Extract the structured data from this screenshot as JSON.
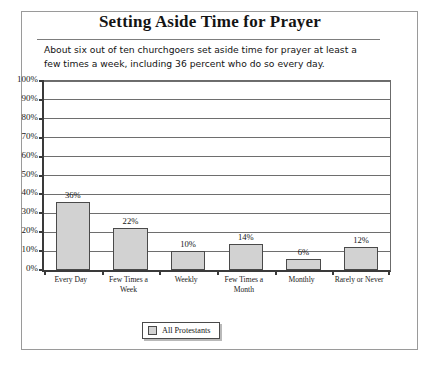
{
  "figure": {
    "title": "Setting Aside Time for Prayer",
    "subtitle": "About six out of ten churchgoers set aside time for prayer at least a few times a week, including 36 percent who do so every day."
  },
  "legend": {
    "label": "All Protestants",
    "swatch_color": "#d2d2d2",
    "position": "bottom-center"
  },
  "colors": {
    "bar_fill": "#d2d2d2",
    "bar_border": "#4a4a4a",
    "axis": "#3a3a3a",
    "gridline": "#6e6e6e",
    "frame": "#9a9a9a",
    "text": "#151515"
  },
  "chart_data": {
    "type": "bar",
    "title": "Setting Aside Time for Prayer",
    "subtitle": "About six out of ten churchgoers set aside time for prayer at least a few times a week, including 36 percent who do so every day.",
    "categories": [
      "Every Day",
      "Few Times a Week",
      "Weekly",
      "Few Times a Month",
      "Monthly",
      "Rarely or Never"
    ],
    "series": [
      {
        "name": "All Protestants",
        "values": [
          36,
          22,
          10,
          14,
          6,
          12
        ]
      }
    ],
    "data_labels": [
      "36%",
      "22%",
      "10%",
      "14%",
      "6%",
      "12%"
    ],
    "xlabel": "",
    "ylabel": "",
    "ylim": [
      0,
      100
    ],
    "ytick_step": 10,
    "ytick_labels": [
      "0%",
      "10%",
      "20%",
      "30%",
      "40%",
      "50%",
      "60%",
      "70%",
      "80%",
      "90%",
      "100%"
    ],
    "grid": true,
    "legend_position": "bottom-center"
  }
}
